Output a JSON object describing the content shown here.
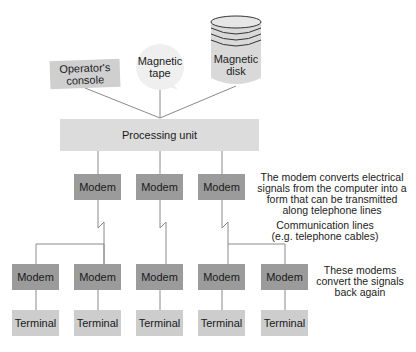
{
  "peripherals": {
    "console": "Operator's console",
    "console_l1": "Operator's",
    "console_l2": "console",
    "tape_l1": "Magnetic",
    "tape_l2": "tape",
    "disk_l1": "Magnetic",
    "disk_l2": "disk"
  },
  "processing_unit": "Processing unit",
  "upper_modems": [
    "Modem",
    "Modem",
    "Modem"
  ],
  "lower_modems": [
    "Modem",
    "Modem",
    "Modem",
    "Modem",
    "Modem"
  ],
  "terminals": [
    "Terminal",
    "Terminal",
    "Terminal",
    "Terminal",
    "Terminal"
  ],
  "notes": {
    "modem_convert": [
      "The modem converts electrical",
      "signals from the computer into a",
      "form that can be transmitted",
      "along telephone lines"
    ],
    "comm_lines": [
      "Communication lines",
      "(e.g. telephone cables)"
    ],
    "convert_back": [
      "These modems",
      "convert the signals",
      "back again"
    ]
  },
  "colors": {
    "modem": "#9b9b9b",
    "terminal": "#cdcdcd",
    "processing_unit": "#dcdcdc",
    "line": "#8a8a8a"
  }
}
